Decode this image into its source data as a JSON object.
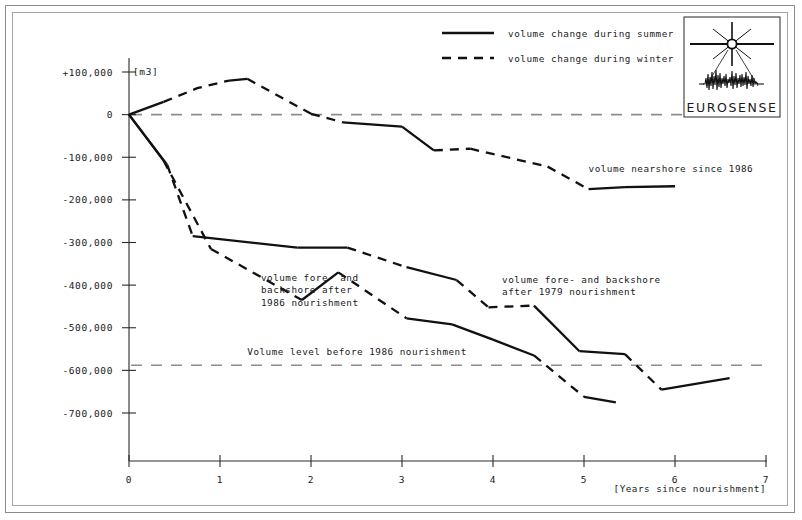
{
  "chart_data": {
    "type": "line",
    "title": "",
    "xlabel": "[Years since nourishment]",
    "ylabel": "[m3]",
    "xlim": [
      0,
      7
    ],
    "ylim": [
      -750000,
      100000
    ],
    "xticks": [
      0,
      1,
      2,
      3,
      4,
      5,
      6,
      7
    ],
    "xtick_labels": [
      "0",
      "1",
      "2",
      "3",
      "4",
      "5",
      "6",
      "7"
    ],
    "yticks": [
      100000,
      0,
      -100000,
      -200000,
      -300000,
      -400000,
      -500000,
      -600000,
      -700000
    ],
    "ytick_labels": [
      "+100,000",
      "0",
      "-100,000",
      "-200,000",
      "-300,000",
      "-400,000",
      "-500,000",
      "-600,000",
      "-700,000"
    ],
    "grid": false,
    "legend_position": "top-center",
    "legend": [
      {
        "label": "volume change during summer",
        "style": "solid"
      },
      {
        "label": "volume change during winter",
        "style": "dashed"
      }
    ],
    "reference_lines": [
      {
        "label": "",
        "y": 0,
        "style": "dashed",
        "color": "#8d8d8d"
      },
      {
        "label": "Volume level before 1986 nourishment",
        "y": -588000,
        "style": "dashed",
        "color": "#8d8d8d"
      }
    ],
    "series": [
      {
        "name": "volume nearshore since 1986",
        "x": [
          0.0,
          0.75,
          1.3,
          2.0,
          2.35,
          2.45,
          3.0,
          3.35,
          3.75,
          4.6,
          5.05,
          5.45,
          6.0
        ],
        "values": [
          0,
          62000,
          84000,
          2000,
          -18000,
          -20000,
          -28000,
          -84000,
          -80000,
          -122000,
          -175000,
          -170000,
          -168000
        ],
        "segments": [
          {
            "x": [
              0.0,
              0.38
            ],
            "y": [
              0,
              30000
            ],
            "style": "solid"
          },
          {
            "x": [
              0.38,
              0.75,
              1.1
            ],
            "y": [
              30000,
              62000,
              80000
            ],
            "style": "dashed"
          },
          {
            "x": [
              1.1,
              1.3
            ],
            "y": [
              80000,
              84000
            ],
            "style": "solid"
          },
          {
            "x": [
              1.3,
              2.0
            ],
            "y": [
              84000,
              2000
            ],
            "style": "dashed"
          },
          {
            "x": [
              2.0,
              2.35
            ],
            "y": [
              2000,
              -18000
            ],
            "style": "dashed"
          },
          {
            "x": [
              2.35,
              3.0
            ],
            "y": [
              -18000,
              -28000
            ],
            "style": "solid"
          },
          {
            "x": [
              3.0,
              3.35
            ],
            "y": [
              -28000,
              -84000
            ],
            "style": "solid"
          },
          {
            "x": [
              3.35,
              3.75
            ],
            "y": [
              -84000,
              -80000
            ],
            "style": "dashed"
          },
          {
            "x": [
              3.75,
              4.6
            ],
            "y": [
              -80000,
              -122000
            ],
            "style": "dashed"
          },
          {
            "x": [
              4.6,
              5.05
            ],
            "y": [
              -122000,
              -175000
            ],
            "style": "dashed"
          },
          {
            "x": [
              5.05,
              5.45
            ],
            "y": [
              -175000,
              -170000
            ],
            "style": "solid"
          },
          {
            "x": [
              5.45,
              6.0
            ],
            "y": [
              -170000,
              -168000
            ],
            "style": "solid"
          }
        ]
      },
      {
        "name": "volume fore- and backshore after 1979 nourishment",
        "x": [
          0.0,
          0.7,
          1.85,
          2.4,
          3.05,
          3.6,
          3.95,
          4.45,
          4.95,
          5.45,
          5.85,
          6.6
        ],
        "values": [
          0,
          -285000,
          -312000,
          -312000,
          -358000,
          -388000,
          -452000,
          -448000,
          -555000,
          -562000,
          -645000,
          -618000
        ],
        "segments": [
          {
            "x": [
              0.0,
              0.42
            ],
            "y": [
              0,
              -118000
            ],
            "style": "solid"
          },
          {
            "x": [
              0.42,
              0.7
            ],
            "y": [
              -118000,
              -285000
            ],
            "style": "dashed"
          },
          {
            "x": [
              0.7,
              1.85
            ],
            "y": [
              -285000,
              -312000
            ],
            "style": "solid"
          },
          {
            "x": [
              1.85,
              2.4
            ],
            "y": [
              -312000,
              -312000
            ],
            "style": "solid"
          },
          {
            "x": [
              2.4,
              3.05
            ],
            "y": [
              -312000,
              -358000
            ],
            "style": "dashed"
          },
          {
            "x": [
              3.05,
              3.6
            ],
            "y": [
              -358000,
              -388000
            ],
            "style": "solid"
          },
          {
            "x": [
              3.6,
              3.95
            ],
            "y": [
              -388000,
              -452000
            ],
            "style": "dashed"
          },
          {
            "x": [
              3.95,
              4.45
            ],
            "y": [
              -452000,
              -448000
            ],
            "style": "dashed"
          },
          {
            "x": [
              4.45,
              4.95
            ],
            "y": [
              -448000,
              -555000
            ],
            "style": "solid"
          },
          {
            "x": [
              4.95,
              5.45
            ],
            "y": [
              -555000,
              -562000
            ],
            "style": "solid"
          },
          {
            "x": [
              5.45,
              5.85
            ],
            "y": [
              -562000,
              -645000
            ],
            "style": "dashed"
          },
          {
            "x": [
              5.85,
              6.6
            ],
            "y": [
              -645000,
              -618000
            ],
            "style": "solid"
          }
        ]
      },
      {
        "name": "volume fore- and backshore after 1986 nourishment",
        "x": [
          0.0,
          0.9,
          1.9,
          2.3,
          3.05,
          3.55,
          4.0,
          4.45,
          5.0,
          5.35
        ],
        "values": [
          0,
          -315000,
          -435000,
          -370000,
          -478000,
          -492000,
          -528000,
          -565000,
          -662000,
          -675000
        ],
        "segments": [
          {
            "x": [
              0.0,
              0.38
            ],
            "y": [
              0,
              -108000
            ],
            "style": "solid"
          },
          {
            "x": [
              0.38,
              0.9
            ],
            "y": [
              -108000,
              -315000
            ],
            "style": "dashed"
          },
          {
            "x": [
              0.9,
              1.9
            ],
            "y": [
              -315000,
              -435000
            ],
            "style": "dashed"
          },
          {
            "x": [
              1.9,
              2.3
            ],
            "y": [
              -435000,
              -370000
            ],
            "style": "solid"
          },
          {
            "x": [
              2.3,
              3.05
            ],
            "y": [
              -370000,
              -478000
            ],
            "style": "dashed"
          },
          {
            "x": [
              3.05,
              3.55
            ],
            "y": [
              -478000,
              -492000
            ],
            "style": "solid"
          },
          {
            "x": [
              3.55,
              4.0
            ],
            "y": [
              -492000,
              -528000
            ],
            "style": "solid"
          },
          {
            "x": [
              4.0,
              4.45
            ],
            "y": [
              -528000,
              -565000
            ],
            "style": "solid"
          },
          {
            "x": [
              4.45,
              5.0
            ],
            "y": [
              -565000,
              -662000
            ],
            "style": "dashed"
          },
          {
            "x": [
              5.0,
              5.35
            ],
            "y": [
              -662000,
              -675000
            ],
            "style": "solid"
          }
        ]
      }
    ],
    "annotations": [
      {
        "text": "volume nearshore since 1986",
        "x": 5.05,
        "y": -135000
      },
      {
        "text_lines": [
          "volume fore- and",
          "backshore after",
          "1986 nourishment"
        ],
        "x": 1.45,
        "y": -390000
      },
      {
        "text_lines": [
          "volume fore- and backshore",
          "after 1979 nourishment"
        ],
        "x": 4.1,
        "y": -395000
      },
      {
        "text": "Volume level before 1986 nourishment",
        "x": 1.3,
        "y": -565000
      }
    ]
  },
  "logo": {
    "name": "EUROSENSE",
    "icon": "aerial-survey-star-icon"
  }
}
